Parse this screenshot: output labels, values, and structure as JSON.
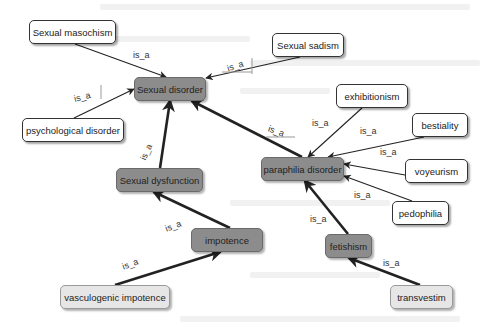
{
  "diagram": {
    "type": "concept-map",
    "relation_label": "is_a",
    "colors": {
      "white_node_fill": "#ffffff",
      "dark_node_fill": "#8c8c8c",
      "light_node_fill": "#e6e6e6",
      "edge": "#222222"
    },
    "nodes": [
      {
        "id": "masochism",
        "label": "Sexual masochism",
        "style": "white",
        "x": 29,
        "y": 20,
        "w": 87,
        "h": 24
      },
      {
        "id": "sadism",
        "label": "Sexual sadism",
        "style": "white",
        "x": 272,
        "y": 33,
        "w": 72,
        "h": 24
      },
      {
        "id": "sexual_disorder",
        "label": "Sexual disorder",
        "style": "dark",
        "x": 134,
        "y": 77,
        "w": 72,
        "h": 24
      },
      {
        "id": "psych",
        "label": "psychological disorder",
        "style": "white",
        "x": 22,
        "y": 118,
        "w": 102,
        "h": 24
      },
      {
        "id": "exhibitionism",
        "label": "exhibitionism",
        "style": "white",
        "x": 336,
        "y": 84,
        "w": 72,
        "h": 24
      },
      {
        "id": "bestiality",
        "label": "bestiality",
        "style": "white",
        "x": 412,
        "y": 113,
        "w": 56,
        "h": 24
      },
      {
        "id": "voyeurism",
        "label": "voyeurism",
        "style": "white",
        "x": 405,
        "y": 159,
        "w": 63,
        "h": 24
      },
      {
        "id": "pedophilia",
        "label": "pedophilia",
        "style": "white",
        "x": 392,
        "y": 201,
        "w": 57,
        "h": 24
      },
      {
        "id": "paraphilia",
        "label": "paraphilia disorder",
        "style": "dark",
        "x": 261,
        "y": 157,
        "w": 83,
        "h": 24
      },
      {
        "id": "dysfunction",
        "label": "Sexual dysfunction",
        "style": "dark",
        "x": 116,
        "y": 168,
        "w": 87,
        "h": 24
      },
      {
        "id": "impotence",
        "label": "impotence",
        "style": "dark",
        "x": 191,
        "y": 228,
        "w": 72,
        "h": 24
      },
      {
        "id": "fetishism",
        "label": "fetishism",
        "style": "dark",
        "x": 325,
        "y": 234,
        "w": 47,
        "h": 24
      },
      {
        "id": "vasculogenic",
        "label": "vasculogenic impotence",
        "style": "light",
        "x": 60,
        "y": 285,
        "w": 110,
        "h": 24
      },
      {
        "id": "transvestim",
        "label": "transvestim",
        "style": "light",
        "x": 390,
        "y": 285,
        "w": 63,
        "h": 24
      }
    ],
    "edges": [
      {
        "from": "masochism",
        "to": "sexual_disorder",
        "label": "is_a",
        "weight": "thin",
        "x1": 75,
        "y1": 44,
        "x2": 166,
        "y2": 77,
        "lx": 133,
        "ly": 50,
        "rot": 0
      },
      {
        "from": "sadism",
        "to": "sexual_disorder",
        "label": "is_a",
        "weight": "thin",
        "x1": 300,
        "y1": 57,
        "x2": 206,
        "y2": 78,
        "lx": 227,
        "ly": 61,
        "rot": -18
      },
      {
        "from": "psych",
        "to": "sexual_disorder",
        "label": "is_a",
        "weight": "thin",
        "x1": 74,
        "y1": 118,
        "x2": 134,
        "y2": 89,
        "lx": 74,
        "ly": 92,
        "rot": -15
      },
      {
        "from": "dysfunction",
        "to": "sexual_disorder",
        "label": "is_a",
        "weight": "thick",
        "x1": 160,
        "y1": 168,
        "x2": 170,
        "y2": 101,
        "lx": 138,
        "ly": 147,
        "rot": -65
      },
      {
        "from": "paraphilia",
        "to": "sexual_disorder",
        "label": "is_a",
        "weight": "thick",
        "x1": 302,
        "y1": 157,
        "x2": 192,
        "y2": 101,
        "lx": 268,
        "ly": 126,
        "rot": 20
      },
      {
        "from": "exhibitionism",
        "to": "paraphilia",
        "label": "is_a",
        "weight": "thin",
        "x1": 362,
        "y1": 108,
        "x2": 308,
        "y2": 157,
        "lx": 312,
        "ly": 118,
        "rot": 0
      },
      {
        "from": "bestiality",
        "to": "paraphilia",
        "label": "is_a",
        "weight": "thin",
        "x1": 424,
        "y1": 137,
        "x2": 328,
        "y2": 157,
        "lx": 360,
        "ly": 126,
        "rot": 0
      },
      {
        "from": "voyeurism",
        "to": "paraphilia",
        "label": "is_a",
        "weight": "thin",
        "x1": 405,
        "y1": 175,
        "x2": 344,
        "y2": 164,
        "lx": 380,
        "ly": 147,
        "rot": 0
      },
      {
        "from": "pedophilia",
        "to": "paraphilia",
        "label": "is_a",
        "weight": "thin",
        "x1": 412,
        "y1": 201,
        "x2": 344,
        "y2": 176,
        "lx": 354,
        "ly": 190,
        "rot": 0
      },
      {
        "from": "impotence",
        "to": "dysfunction",
        "label": "is_a",
        "weight": "thick",
        "x1": 230,
        "y1": 228,
        "x2": 154,
        "y2": 192,
        "lx": 165,
        "ly": 221,
        "rot": -20
      },
      {
        "from": "fetishism",
        "to": "paraphilia",
        "label": "is_a",
        "weight": "thick",
        "x1": 348,
        "y1": 234,
        "x2": 305,
        "y2": 181,
        "lx": 310,
        "ly": 214,
        "rot": 0
      },
      {
        "from": "vasculogenic",
        "to": "impotence",
        "label": "is_a",
        "weight": "thick",
        "x1": 115,
        "y1": 285,
        "x2": 220,
        "y2": 252,
        "lx": 122,
        "ly": 259,
        "rot": -20
      },
      {
        "from": "transvestim",
        "to": "fetishism",
        "label": "is_a",
        "weight": "thick",
        "x1": 420,
        "y1": 285,
        "x2": 349,
        "y2": 258,
        "lx": 383,
        "ly": 258,
        "rot": 0
      }
    ]
  }
}
